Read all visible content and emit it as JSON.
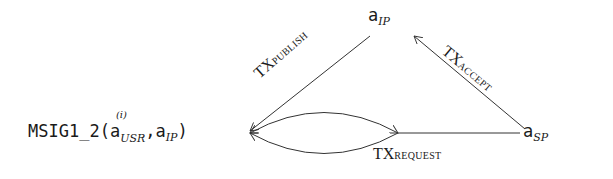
{
  "diagram": {
    "nodes": {
      "ip": {
        "base": "a",
        "subscript": "IP"
      },
      "sp": {
        "base": "a",
        "subscript": "SP"
      },
      "msig": {
        "prefix": "MSIG1_2(",
        "arg1_base": "a",
        "arg1_superscript": "(i)",
        "arg1_subscript": "USR",
        "separator": ",",
        "arg2_base": "a",
        "arg2_subscript": "IP",
        "suffix": ")"
      }
    },
    "edges": {
      "publish": {
        "prefix": "TX",
        "label": "PUBLISH",
        "from": "a_IP",
        "to": "MSIG1_2"
      },
      "accept": {
        "prefix": "TX",
        "label": "ACCEPT",
        "from": "a_SP",
        "to": "a_IP"
      },
      "request": {
        "prefix": "TX",
        "label": "REQUEST",
        "from": "a_SP",
        "to": "MSIG1_2"
      }
    },
    "colors": {
      "stroke": "#333333",
      "text": "#1a1a1a",
      "background": "#ffffff"
    }
  }
}
